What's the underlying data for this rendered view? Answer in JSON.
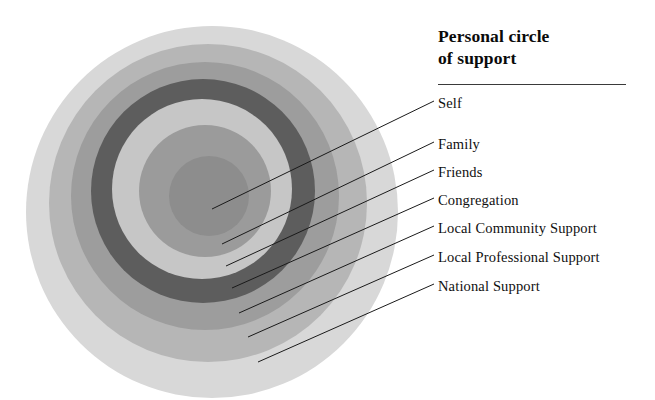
{
  "legend": {
    "title_line1": "Personal circle",
    "title_line2": "of support",
    "items": [
      {
        "label": "Self",
        "x": 438,
        "y": 95,
        "line_from": [
          212,
          209
        ],
        "line_to": [
          434,
          101
        ]
      },
      {
        "label": "Family",
        "x": 438,
        "y": 136,
        "line_from": [
          222,
          244
        ],
        "line_to": [
          434,
          142
        ]
      },
      {
        "label": "Friends",
        "x": 438,
        "y": 164,
        "line_from": [
          226,
          266
        ],
        "line_to": [
          434,
          170
        ]
      },
      {
        "label": "Congregation",
        "x": 438,
        "y": 192,
        "line_from": [
          232,
          288
        ],
        "line_to": [
          434,
          198
        ]
      },
      {
        "label": "Local Community Support",
        "x": 438,
        "y": 220,
        "line_from": [
          239,
          313
        ],
        "line_to": [
          434,
          226
        ]
      },
      {
        "label": "Local Professional Support",
        "x": 438,
        "y": 249,
        "line_from": [
          248,
          337
        ],
        "line_to": [
          434,
          255
        ]
      },
      {
        "label": "National Support",
        "x": 438,
        "y": 278,
        "line_from": [
          258,
          362
        ],
        "line_to": [
          434,
          284
        ]
      }
    ]
  },
  "chart_data": {
    "type": "pie",
    "title": "Personal circle of support",
    "categories": [
      "Self",
      "Family",
      "Friends",
      "Congregation",
      "Local Community Support",
      "Local Professional Support",
      "National Support"
    ],
    "rings": [
      {
        "name": "National Support",
        "level": 7,
        "cx": 212,
        "cy": 212,
        "r": 186,
        "color": "#d8d8d8"
      },
      {
        "name": "Local Professional Support",
        "level": 6,
        "cx": 208,
        "cy": 203,
        "r": 159,
        "color": "#b6b6b6"
      },
      {
        "name": "Local Community Support",
        "level": 5,
        "cx": 205,
        "cy": 196,
        "r": 134,
        "color": "#9d9d9d"
      },
      {
        "name": "Congregation",
        "level": 4,
        "cx": 203,
        "cy": 191,
        "r": 112,
        "color": "#5d5d5d"
      },
      {
        "name": "Friends",
        "level": 3,
        "cx": 202,
        "cy": 189,
        "r": 90,
        "color": "#c6c6c6"
      },
      {
        "name": "Family",
        "level": 2,
        "cx": 205,
        "cy": 191,
        "r": 66,
        "color": "#9b9b9b"
      },
      {
        "name": "Self",
        "level": 1,
        "cx": 209,
        "cy": 196,
        "r": 40,
        "color": "#8d8d8d"
      }
    ],
    "colors": {
      "outermost": "#d8d8d8",
      "dark_ring": "#5d5d5d",
      "core": "#8d8d8d",
      "leader_line": "#1a1a1a",
      "background": "#ffffff"
    },
    "grid": false,
    "legend_position": "right"
  }
}
